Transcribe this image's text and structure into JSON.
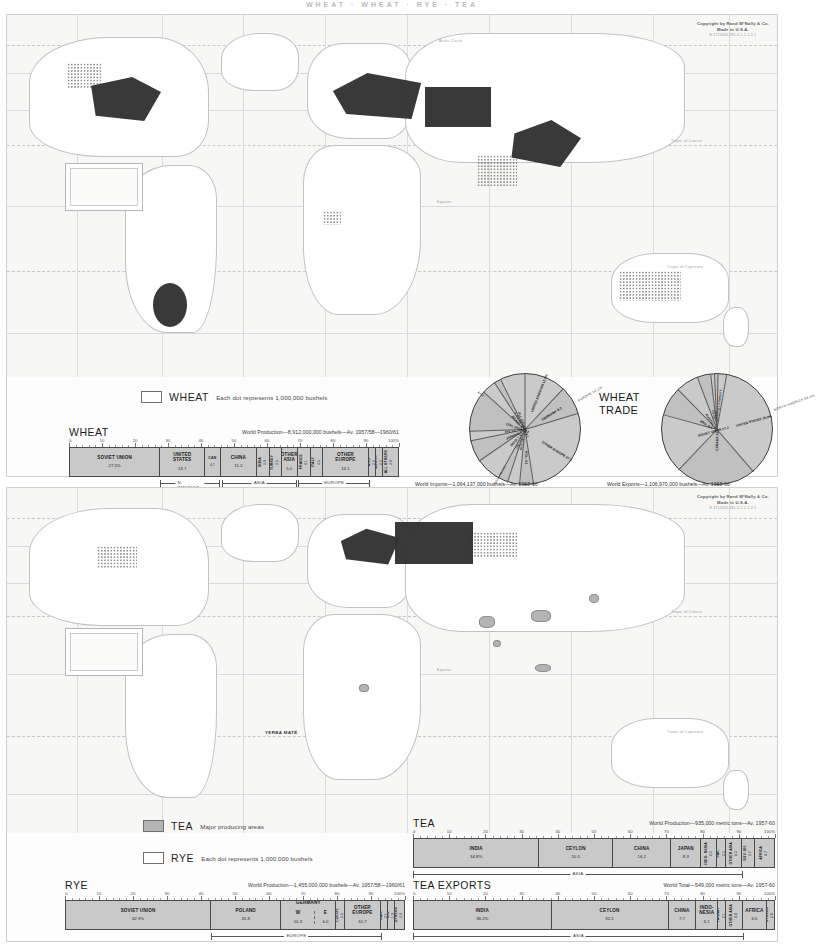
{
  "page": {
    "header": "WHEAT  ·  WHEAT  ·  RYE  ·  TEA",
    "copyright_line1": "Copyright by Rand MᶜNally & Co.",
    "copyright_line2": "Made in U.S.A.",
    "copyright_line3": "R-5712060-385-3-1-1-1-2-1"
  },
  "map_labels": {
    "arctic_circle": "Arctic Circle",
    "tropic_cancer": "Tropic of Cancer",
    "equator": "Equator",
    "tropic_capricorn": "Tropic of Capricorn",
    "yerba_mate": "YERBA MATÉ"
  },
  "wheat_panel": {
    "legend": {
      "swatch": "dot-stipple",
      "title": "WHEAT",
      "description": "Each dot represents 1,000,000 bushels"
    },
    "bar": {
      "title": "WHEAT",
      "source": "World Production—8,912,000,000 bushels—Av. 1957/58—1960/61",
      "axis_ticks": [
        "0",
        "10",
        "20",
        "30",
        "40",
        "50",
        "60",
        "70",
        "80",
        "90",
        "100%"
      ],
      "segments": [
        {
          "name": "SOVIET UNION",
          "value": "27.5%",
          "pct": 27.5,
          "orient": "h"
        },
        {
          "name": "UNITED\nSTATES",
          "value": "13.7",
          "pct": 13.7,
          "orient": "h"
        },
        {
          "name": "CAN",
          "value": "4.7",
          "pct": 4.7,
          "orient": "h"
        },
        {
          "name": "CHINA",
          "value": "11.2",
          "pct": 11.2,
          "orient": "h"
        },
        {
          "name": "INDIA",
          "value": "3.9",
          "pct": 3.9,
          "orient": "v"
        },
        {
          "name": "TURKEY",
          "value": "3.5",
          "pct": 3.5,
          "orient": "v"
        },
        {
          "name": "OTHER\nASIA",
          "value": "5.0",
          "pct": 5.0,
          "orient": "h"
        },
        {
          "name": "FRANCE",
          "value": "4.1",
          "pct": 4.1,
          "orient": "v"
        },
        {
          "name": "ITALY",
          "value": "3.5",
          "pct": 3.5,
          "orient": "v"
        },
        {
          "name": "OTHER\nEUROPE",
          "value": "14.1",
          "pct": 14.1,
          "orient": "h"
        },
        {
          "name": "ARG.",
          "value": "2.2",
          "pct": 2.2,
          "orient": "v"
        },
        {
          "name": "AUSTR.",
          "value": "2.2",
          "pct": 2.2,
          "orient": "v"
        },
        {
          "name": "ALL\nOTHERS",
          "value": "3.4",
          "pct": 3.4,
          "orient": "v"
        }
      ],
      "brackets": [
        {
          "label": "N. AMERICA",
          "start": 27.5,
          "end": 45.9
        },
        {
          "label": "ASIA",
          "start": 46.4,
          "end": 69.0
        },
        {
          "label": "EUROPE",
          "start": 69.5,
          "end": 91.2
        }
      ]
    },
    "trade": {
      "heading_line1": "WHEAT",
      "heading_line2": "TRADE",
      "imports": {
        "caption": "World Imports—1,064,137,000 bushels—Av. 1958-60",
        "region_arcs": [
          {
            "label": "EUROPE 54.1%",
            "pct": 54.1
          },
          {
            "label": "ASIA 28.4%",
            "pct": 28.4
          },
          {
            "label": "AFR.",
            "pct": 6.0
          }
        ],
        "slices": [
          {
            "name": "UNITED KINGDOM",
            "value": "12.0%",
            "pct": 12.0
          },
          {
            "name": "GERMANY",
            "value": "8.3",
            "pct": 8.3,
            "sub": "W 8.3  E 4.1"
          },
          {
            "name": "OTHER EUROPE",
            "value": "27.2",
            "pct": 27.2
          },
          {
            "name": "POL.",
            "value": "4.1",
            "pct": 4.1
          },
          {
            "name": "NETH.",
            "value": "3.5",
            "pct": 3.5
          },
          {
            "name": "ITALY",
            "value": "2.9",
            "pct": 2.9
          },
          {
            "name": "INDIA",
            "value": "7.4",
            "pct": 7.4
          },
          {
            "name": "JAPAN",
            "value": "6.3",
            "pct": 6.3
          },
          {
            "name": "PAK.",
            "value": "2.8",
            "pct": 2.8
          },
          {
            "name": "OTH. ASIA",
            "value": "12.2",
            "pct": 12.2
          },
          {
            "name": "BRAZIL",
            "value": "4.1",
            "pct": 4.1
          },
          {
            "name": "S. AM.",
            "value": "2.0",
            "pct": 2.0
          },
          {
            "name": "ALL OTHERS",
            "value": "4.1",
            "pct": 4.1
          }
        ]
      },
      "exports": {
        "caption": "World Exports—1,106,970,000 bushels—Av. 1958-60",
        "region_arcs": [
          {
            "label": "NORTH AMERICA 59.4%",
            "pct": 59.4
          }
        ],
        "slices": [
          {
            "name": "UNITED STATES",
            "value": "35.9%",
            "pct": 35.9
          },
          {
            "name": "CANADA",
            "value": "23.4",
            "pct": 23.4
          },
          {
            "name": "SOVIET UNION",
            "value": "17.2",
            "pct": 17.2
          },
          {
            "name": "ARG.",
            "value": "8.4",
            "pct": 8.4
          },
          {
            "name": "AUSTRL.",
            "value": "6.6",
            "pct": 6.6
          },
          {
            "name": "FR.",
            "value": "3.9",
            "pct": 3.9
          },
          {
            "name": "SWE.",
            "value": "1.1",
            "pct": 1.1
          },
          {
            "name": "TUR.",
            "value": "1.0",
            "pct": 1.0
          },
          {
            "name": "ALL OTHERS",
            "value": "2.5",
            "pct": 2.5
          }
        ]
      }
    }
  },
  "tea_panel": {
    "legend_tea": {
      "swatch": "solid-gray",
      "title": "TEA",
      "description": "Major producing areas"
    },
    "legend_rye": {
      "swatch": "dot-stipple",
      "title": "RYE",
      "description": "Each dot represents 1,000,000 bushels"
    },
    "tea_bar": {
      "title": "TEA",
      "source": "World Production—935,000 metric tons—Av. 1957-60",
      "axis_ticks": [
        "0",
        "10",
        "20",
        "30",
        "40",
        "50",
        "60",
        "70",
        "80",
        "90",
        "100%"
      ],
      "segments": [
        {
          "name": "INDIA",
          "value": "34.8%",
          "pct": 34.8,
          "orient": "h"
        },
        {
          "name": "CEYLON",
          "value": "20.5",
          "pct": 20.5,
          "orient": "h"
        },
        {
          "name": "CHINA",
          "value": "16.2",
          "pct": 16.2,
          "orient": "h"
        },
        {
          "name": "JAPAN",
          "value": "8.3",
          "pct": 8.3,
          "orient": "h"
        },
        {
          "name": "INDO-\nNESIA",
          "value": "4.5",
          "pct": 4.5,
          "orient": "v"
        },
        {
          "name": "PAK.",
          "value": "2.5",
          "pct": 2.5,
          "orient": "v"
        },
        {
          "name": "OTHER\nASIA",
          "value": "4.3",
          "pct": 4.3,
          "orient": "v"
        },
        {
          "name": "SOV. UN.",
          "value": "3.7",
          "pct": 3.7,
          "orient": "v"
        },
        {
          "name": "AFRICA",
          "value": "4.7",
          "pct": 4.7,
          "orient": "v"
        }
      ],
      "brackets": [
        {
          "label": "ASIA",
          "start": 0.0,
          "end": 91.1
        }
      ]
    },
    "tea_exports_bar": {
      "title": "TEA EXPORTS",
      "source": "World Total—549,000 metric tons—Av. 1957-60",
      "axis_ticks": [
        "0",
        "10",
        "20",
        "30",
        "40",
        "50",
        "60",
        "70",
        "80",
        "90",
        "100%"
      ],
      "segments": [
        {
          "name": "INDIA",
          "value": "38.2%",
          "pct": 38.2,
          "orient": "h"
        },
        {
          "name": "CEYLON",
          "value": "32.5",
          "pct": 32.5,
          "orient": "h"
        },
        {
          "name": "CHINA",
          "value": "7.7",
          "pct": 7.7,
          "orient": "h"
        },
        {
          "name": "INDO-\nNESIA",
          "value": "6.1",
          "pct": 6.1,
          "orient": "h"
        },
        {
          "name": "TAIWAN",
          "value": "2.1",
          "pct": 2.1,
          "orient": "v"
        },
        {
          "name": "OTHER\nASIA",
          "value": "4.8",
          "pct": 4.8,
          "orient": "v"
        },
        {
          "name": "AFRICA",
          "value": "6.6",
          "pct": 6.6,
          "orient": "h"
        },
        {
          "name": "OTHERS",
          "value": "2.0",
          "pct": 2.0,
          "orient": "v"
        }
      ],
      "brackets": [
        {
          "label": "ASIA",
          "start": 0.0,
          "end": 91.4
        }
      ]
    },
    "rye_bar": {
      "title": "RYE",
      "source": "World Production—1,455,000,000 bushels—Av. 1957/58—1960/61",
      "axis_ticks": [
        "0",
        "10",
        "20",
        "30",
        "40",
        "50",
        "60",
        "70",
        "80",
        "90",
        "100%"
      ],
      "segments": [
        {
          "name": "SOVIET UNION",
          "value": "42.9%",
          "pct": 42.9,
          "orient": "h"
        },
        {
          "name": "POLAND",
          "value": "20.8",
          "pct": 20.8,
          "orient": "h"
        },
        {
          "name": "GERMANY",
          "value": "",
          "pct": 16.3,
          "orient": "h",
          "split": [
            {
              "name": "W",
              "value": "10.3",
              "pct": 10.3
            },
            {
              "name": "E",
              "value": "6.0",
              "pct": 6.0
            }
          ]
        },
        {
          "name": "CZECH.",
          "value": "2.5",
          "pct": 2.5,
          "orient": "v"
        },
        {
          "name": "OTHER\nEUROPE",
          "value": "10.7",
          "pct": 10.7,
          "orient": "h"
        },
        {
          "name": "CAN.",
          "value": "2.1",
          "pct": 2.1,
          "orient": "v"
        },
        {
          "name": "U.S.",
          "value": "1.9",
          "pct": 1.9,
          "orient": "v"
        },
        {
          "name": "OTHERS",
          "value": "2.8",
          "pct": 2.8,
          "orient": "v"
        }
      ],
      "brackets": [
        {
          "label": "EUROPE",
          "start": 42.9,
          "end": 93.2
        }
      ]
    }
  }
}
